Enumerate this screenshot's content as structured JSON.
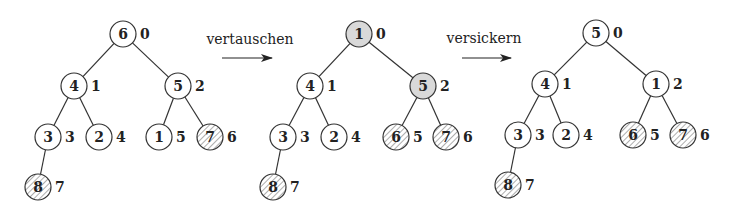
{
  "colors": {
    "stroke": "#333333",
    "fill_normal": "#ffffff",
    "fill_highlight": "#d9d9d9",
    "hatch": "#777777"
  },
  "arrows": [
    {
      "label": "vertauschen",
      "x1": 222,
      "x2": 272,
      "y": 58,
      "label_x": 250,
      "label_y": 44
    },
    {
      "label": "versickern",
      "x1": 462,
      "x2": 511,
      "y": 58,
      "label_x": 484,
      "label_y": 43
    }
  ],
  "trees": [
    {
      "name": "initial",
      "nodes": [
        {
          "index": "0",
          "value": "6",
          "x": 123,
          "y": 34,
          "style": "normal"
        },
        {
          "index": "1",
          "value": "4",
          "x": 74,
          "y": 86,
          "style": "normal"
        },
        {
          "index": "2",
          "value": "5",
          "x": 178,
          "y": 86,
          "style": "normal"
        },
        {
          "index": "3",
          "value": "3",
          "x": 48,
          "y": 137,
          "style": "normal"
        },
        {
          "index": "4",
          "value": "2",
          "x": 99,
          "y": 137,
          "style": "normal"
        },
        {
          "index": "5",
          "value": "1",
          "x": 159,
          "y": 137,
          "style": "normal"
        },
        {
          "index": "6",
          "value": "7",
          "x": 210,
          "y": 137,
          "style": "hatched"
        },
        {
          "index": "7",
          "value": "8",
          "x": 38,
          "y": 187,
          "style": "hatched"
        }
      ]
    },
    {
      "name": "after-swap",
      "nodes": [
        {
          "index": "0",
          "value": "1",
          "x": 359,
          "y": 34,
          "style": "highlight"
        },
        {
          "index": "1",
          "value": "4",
          "x": 310,
          "y": 86,
          "style": "normal"
        },
        {
          "index": "2",
          "value": "5",
          "x": 423,
          "y": 86,
          "style": "highlight"
        },
        {
          "index": "3",
          "value": "3",
          "x": 283,
          "y": 137,
          "style": "normal"
        },
        {
          "index": "4",
          "value": "2",
          "x": 334,
          "y": 137,
          "style": "normal"
        },
        {
          "index": "5",
          "value": "6",
          "x": 396,
          "y": 137,
          "style": "hatched"
        },
        {
          "index": "6",
          "value": "7",
          "x": 446,
          "y": 137,
          "style": "hatched"
        },
        {
          "index": "7",
          "value": "8",
          "x": 273,
          "y": 187,
          "style": "hatched"
        }
      ]
    },
    {
      "name": "after-sift-down",
      "nodes": [
        {
          "index": "0",
          "value": "5",
          "x": 596,
          "y": 33,
          "style": "normal"
        },
        {
          "index": "1",
          "value": "4",
          "x": 545,
          "y": 84,
          "style": "normal"
        },
        {
          "index": "2",
          "value": "1",
          "x": 656,
          "y": 84,
          "style": "normal"
        },
        {
          "index": "3",
          "value": "3",
          "x": 518,
          "y": 135,
          "style": "normal"
        },
        {
          "index": "4",
          "value": "2",
          "x": 566,
          "y": 135,
          "style": "normal"
        },
        {
          "index": "5",
          "value": "6",
          "x": 633,
          "y": 135,
          "style": "hatched"
        },
        {
          "index": "6",
          "value": "7",
          "x": 683,
          "y": 135,
          "style": "hatched"
        },
        {
          "index": "7",
          "value": "8",
          "x": 508,
          "y": 185,
          "style": "hatched"
        }
      ]
    }
  ],
  "edges": [
    [
      0,
      1
    ],
    [
      0,
      2
    ],
    [
      1,
      3
    ],
    [
      1,
      4
    ],
    [
      2,
      5
    ],
    [
      2,
      6
    ],
    [
      3,
      7
    ]
  ],
  "node_radius": 13
}
